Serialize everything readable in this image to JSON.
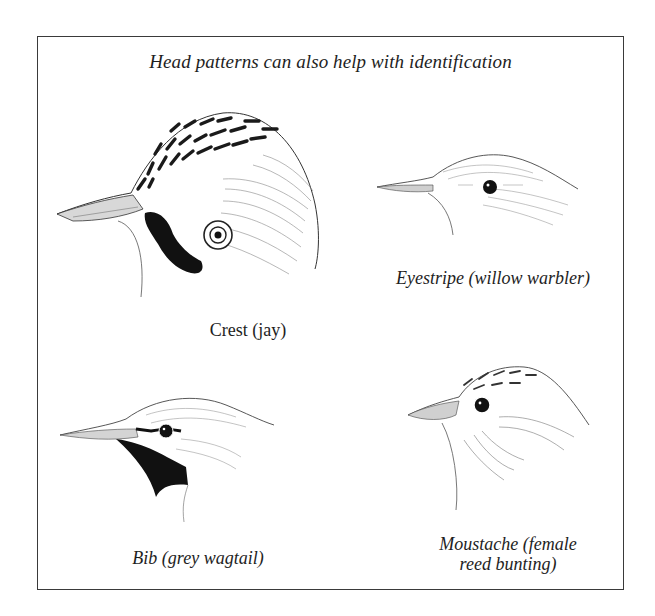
{
  "title": "Head patterns can also help with identification",
  "figures": [
    {
      "id": "crest",
      "caption": "Crest (jay)",
      "pattern": "crest",
      "bird": "jay"
    },
    {
      "id": "eyestripe",
      "caption": "Eyestripe (willow warbler)",
      "pattern": "eyestripe",
      "bird": "willow warbler"
    },
    {
      "id": "bib",
      "caption": "Bib (grey wagtail)",
      "pattern": "bib",
      "bird": "grey wagtail"
    },
    {
      "id": "moustache",
      "caption_line1": "Moustache (female",
      "caption_line2": "reed bunting)",
      "pattern": "moustache",
      "bird": "female reed bunting"
    }
  ],
  "colors": {
    "ink": "#1e1e1e",
    "frame": "#3a3a3a",
    "background": "#ffffff"
  }
}
